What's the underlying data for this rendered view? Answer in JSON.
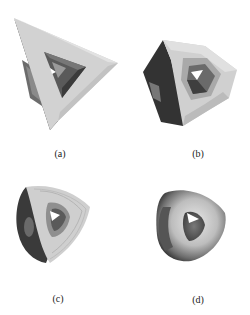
{
  "figure": {
    "panels": [
      {
        "id": "a",
        "label": "(a)",
        "description": "Control mesh: triangular torus (tetrahedral frame with hole)"
      },
      {
        "id": "b",
        "label": "(b)",
        "description": "One subdivision step: faceted torus"
      },
      {
        "id": "c",
        "label": "(c)",
        "description": "Two subdivision steps: finer faceted torus"
      },
      {
        "id": "d",
        "label": "(d)",
        "description": "Limit surface: smooth torus"
      }
    ]
  }
}
